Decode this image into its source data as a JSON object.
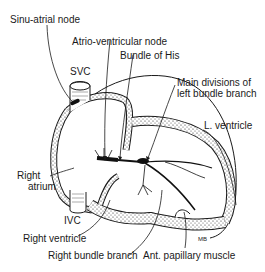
{
  "diagram": {
    "labels": {
      "sa_node": "Sinu-atrial node",
      "av_node": "Atrio-ventricular node",
      "bundle_his": "Bundle of His",
      "main_div_1": "Main divisions of",
      "main_div_2": "left bundle branch",
      "svc": "SVC",
      "l_ventricle": "L. ventricle",
      "right_atrium_1": "Right",
      "right_atrium_2": "atrium",
      "ivc": "IVC",
      "right_ventricle": "Right ventricle",
      "right_bundle": "Right bundle branch",
      "papillary": "Ant. papillary muscle",
      "signature": "MB"
    }
  }
}
